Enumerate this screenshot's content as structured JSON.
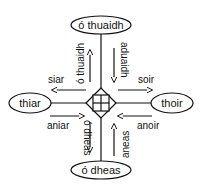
{
  "diagram": {
    "nodes": {
      "north": "ó thuaidh",
      "south": "ó dheas",
      "west": "thiar",
      "east": "thoir"
    },
    "arrows": {
      "to_north": "ó thuaidh",
      "from_north": "aduaidh",
      "to_west": "siar",
      "to_east": "soir",
      "from_west": "aniar",
      "from_east": "anoir",
      "to_south": "ó dheas",
      "from_south": "aneas"
    },
    "colors": {
      "stroke": "#111111",
      "background": "#ffffff"
    }
  }
}
